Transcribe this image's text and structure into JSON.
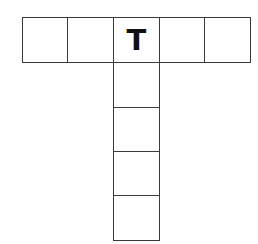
{
  "puzzle": {
    "type": "crossword-t-shape",
    "across": {
      "cells": [
        "",
        "",
        "T",
        "",
        ""
      ]
    },
    "down": {
      "cells": [
        "T",
        "",
        "",
        "",
        ""
      ]
    }
  },
  "colors": {
    "border": "#3a3a3a",
    "letter": "#111111",
    "background": "#ffffff"
  }
}
